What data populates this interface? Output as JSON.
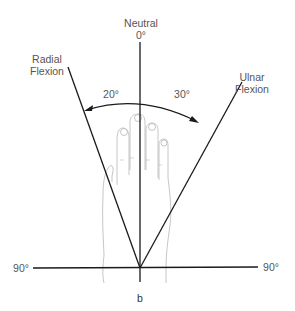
{
  "diagram": {
    "type": "range-of-motion",
    "labels": {
      "neutral": "Neutral",
      "neutral_angle": "0°",
      "radial_line1": "Radial",
      "radial_line2": "Flexion",
      "ulnar_line1": "Ulnar",
      "ulnar_line2": "Flexion",
      "radial_angle": "20°",
      "ulnar_angle": "30°",
      "left_90": "90°",
      "right_90": "90°",
      "panel": "b"
    },
    "colors": {
      "line": "#1a1a1a",
      "text": "#555555",
      "hand": "#b5b5b5"
    }
  }
}
